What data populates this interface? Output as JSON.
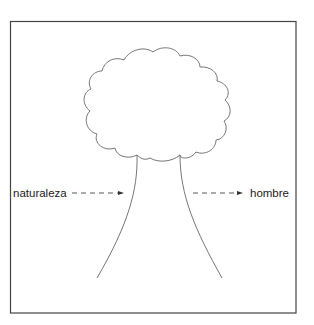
{
  "diagram": {
    "type": "tree-metaphor",
    "labels": {
      "left": "naturaleza",
      "right": "hombre"
    },
    "arrows": [
      {
        "from": "naturaleza",
        "to": "tree-trunk",
        "style": "dashed",
        "direction": "right"
      },
      {
        "from": "tree-trunk",
        "to": "hombre",
        "style": "dashed",
        "direction": "right"
      }
    ],
    "colors": {
      "stroke": "#555555",
      "frame": "#444444",
      "text": "#1a1a1a",
      "background": "#ffffff"
    }
  }
}
